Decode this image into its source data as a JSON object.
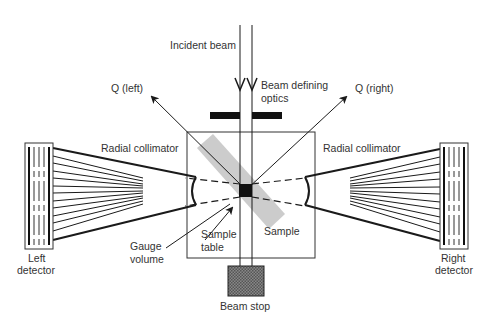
{
  "diagram": {
    "labels": {
      "incident_beam": "Incident beam",
      "beam_defining_optics_1": "Beam defining",
      "beam_defining_optics_2": "optics",
      "q_left": "Q (left)",
      "q_right": "Q (right)",
      "radial_collimator_left": "Radial collimator",
      "radial_collimator_right": "Radial collimator",
      "left_detector_1": "Left",
      "left_detector_2": "detector",
      "right_detector_1": "Right",
      "right_detector_2": "detector",
      "gauge_volume_1": "Gauge",
      "gauge_volume_2": "volume",
      "sample_table_1": "Sample",
      "sample_table_2": "table",
      "sample": "Sample",
      "beam_stop": "Beam stop"
    },
    "colors": {
      "line": "#1a1a1a",
      "sample_fill": "#cccccc",
      "text": "#333333",
      "beam_stop_fill": "#777777"
    }
  }
}
